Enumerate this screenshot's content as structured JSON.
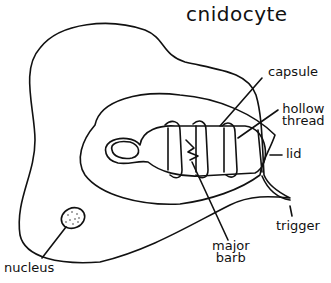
{
  "title": "cnidocyte",
  "labels": {
    "capsule": "capsule",
    "hollow_thread_1": "hollow",
    "hollow_thread_2": "thread",
    "lid": "lid",
    "trigger": "trigger",
    "major_barb_1": "major",
    "major_barb_2": "barb",
    "nucleus": "nucleus"
  },
  "colors": {
    "stroke": "#111111",
    "background": "#ffffff"
  }
}
